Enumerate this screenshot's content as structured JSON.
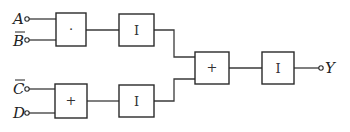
{
  "diagram": {
    "type": "logic-block-diagram",
    "inputs": [
      {
        "id": "A",
        "label": "A",
        "negated": false
      },
      {
        "id": "Bbar",
        "label": "B",
        "negated": true
      },
      {
        "id": "Cbar",
        "label": "C",
        "negated": true
      },
      {
        "id": "D",
        "label": "D",
        "negated": false
      }
    ],
    "blocks": [
      {
        "id": "and1",
        "symbol": "·",
        "kind": "AND",
        "inputs": [
          "A",
          "Bbar"
        ]
      },
      {
        "id": "inv1",
        "symbol": "I",
        "kind": "INVERT",
        "inputs": [
          "and1"
        ]
      },
      {
        "id": "or1",
        "symbol": "+",
        "kind": "OR",
        "inputs": [
          "Cbar",
          "D"
        ]
      },
      {
        "id": "inv2",
        "symbol": "I",
        "kind": "INVERT",
        "inputs": [
          "or1"
        ]
      },
      {
        "id": "or2",
        "symbol": "+",
        "kind": "OR",
        "inputs": [
          "inv1",
          "inv2"
        ]
      },
      {
        "id": "inv3",
        "symbol": "I",
        "kind": "INVERT",
        "inputs": [
          "or2"
        ]
      }
    ],
    "output": {
      "id": "Y",
      "label": "Y",
      "source": "inv3"
    },
    "colors": {
      "line": "#2a2a2a",
      "background": "#ffffff"
    }
  }
}
